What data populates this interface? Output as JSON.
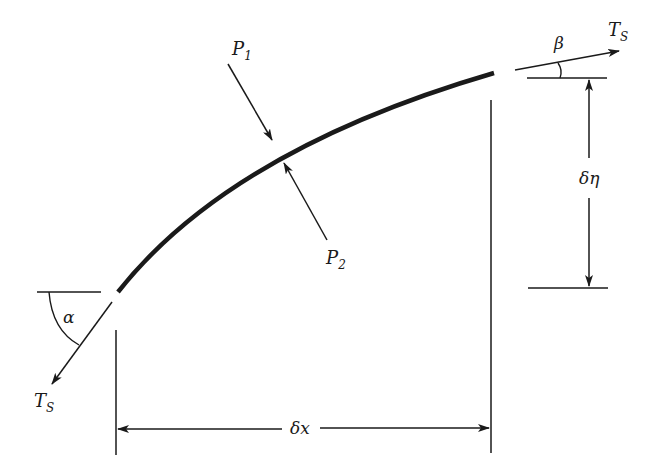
{
  "diagram": {
    "type": "free-body diagram",
    "colors": {
      "ink": "#1a1a1a",
      "background": "#ffffff"
    },
    "labels": {
      "tension_left": {
        "main": "T",
        "sub": "S"
      },
      "tension_right": {
        "main": "T",
        "sub": "S"
      },
      "angle_left": "α",
      "angle_right": "β",
      "load_1": {
        "main": "P",
        "sub": "1"
      },
      "load_2": {
        "main": "P",
        "sub": "2"
      },
      "dim_horizontal": "δx",
      "dim_vertical": "δη"
    }
  }
}
